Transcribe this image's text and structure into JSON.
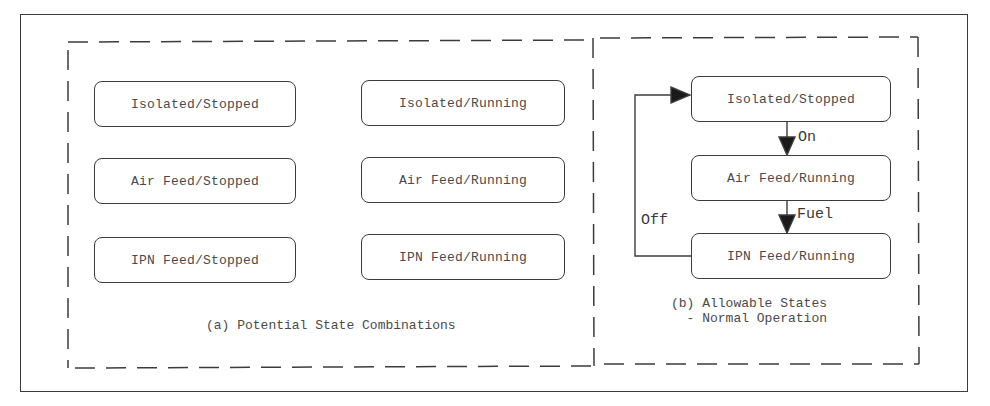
{
  "panel_a": {
    "caption": "(a) Potential State Combinations",
    "states": [
      {
        "label": "Isolated/Stopped"
      },
      {
        "label": "Isolated/Running"
      },
      {
        "label": "Air Feed/Stopped"
      },
      {
        "label": "Air Feed/Running"
      },
      {
        "label": "IPN Feed/Stopped"
      },
      {
        "label": "IPN Feed/Running"
      }
    ]
  },
  "panel_b": {
    "caption_line1": "(b) Allowable States",
    "caption_line2": "  - Normal Operation",
    "states": [
      {
        "label": "Isolated/Stopped"
      },
      {
        "label": "Air Feed/Running"
      },
      {
        "label": "IPN Feed/Running"
      }
    ],
    "transitions": [
      {
        "label": "On",
        "from": "Isolated/Stopped",
        "to": "Air Feed/Running"
      },
      {
        "label": "Fuel",
        "from": "Air Feed/Running",
        "to": "IPN Feed/Running"
      },
      {
        "label": "Off",
        "from": "IPN Feed/Running",
        "to": "Isolated/Stopped"
      }
    ]
  },
  "colors": {
    "line": "#3c3c3c",
    "text": "#4a4a4a",
    "background": "#ffffff"
  }
}
